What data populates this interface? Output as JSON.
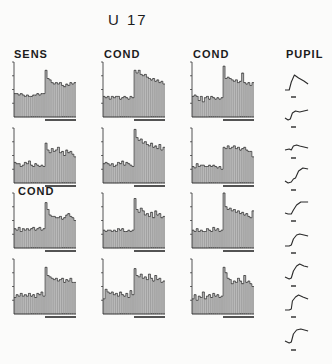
{
  "title": "U 17",
  "column_labels": {
    "sens": "SENS",
    "cond1": "COND",
    "cond2": "COND",
    "pupil": "PUPIL"
  },
  "row3_label": "COND",
  "colors": {
    "ink": "#2a2a2a",
    "bar_fill": "#b9b9b9",
    "bar_edge": "#7a7a7a",
    "background": "#fbfbfa"
  },
  "chart_data": {
    "type": "bar",
    "title": "U 17",
    "ylim": [
      0,
      4
    ],
    "yticks": 4,
    "bars_per_panel": 30,
    "stimulus_onset_bin": 15,
    "panels": [
      {
        "row": 1,
        "col": 1,
        "label": "SENS",
        "values": [
          1.7,
          1.7,
          1.6,
          1.7,
          1.6,
          1.5,
          1.6,
          1.5,
          1.5,
          1.6,
          1.6,
          1.7,
          1.6,
          1.7,
          1.7,
          3.4,
          2.8,
          2.7,
          2.5,
          2.4,
          2.5,
          2.4,
          2.5,
          2.3,
          2.2,
          2.4,
          2.3,
          2.5,
          2.4,
          2.5
        ]
      },
      {
        "row": 1,
        "col": 2,
        "label": "COND",
        "values": [
          1.5,
          1.4,
          1.5,
          1.3,
          1.5,
          1.4,
          1.5,
          1.5,
          1.3,
          1.4,
          1.5,
          1.4,
          1.3,
          1.5,
          1.4,
          3.4,
          3.2,
          3.4,
          3.1,
          3.0,
          3.1,
          2.9,
          2.8,
          2.7,
          2.8,
          2.6,
          2.7,
          2.5,
          2.6,
          2.4
        ]
      },
      {
        "row": 1,
        "col": 3,
        "label": "COND",
        "values": [
          1.5,
          1.6,
          1.5,
          1.2,
          1.5,
          1.1,
          1.4,
          1.5,
          1.3,
          1.5,
          1.4,
          1.3,
          1.4,
          1.3,
          1.4,
          3.7,
          2.8,
          2.9,
          2.8,
          2.7,
          2.6,
          2.7,
          2.5,
          2.6,
          3.2,
          2.5,
          2.4,
          2.5,
          2.3,
          2.5
        ]
      },
      {
        "row": 2,
        "col": 1,
        "label": "",
        "values": [
          1.5,
          1.4,
          1.4,
          1.2,
          1.3,
          1.5,
          1.4,
          1.6,
          1.3,
          1.2,
          1.4,
          1.3,
          1.2,
          1.3,
          1.2,
          2.9,
          2.4,
          2.2,
          2.5,
          2.3,
          2.4,
          2.6,
          2.2,
          2.3,
          2.0,
          2.4,
          2.2,
          2.3,
          2.1,
          1.9
        ]
      },
      {
        "row": 2,
        "col": 2,
        "label": "",
        "values": [
          1.4,
          1.5,
          1.4,
          1.3,
          1.4,
          1.2,
          1.3,
          1.5,
          1.4,
          1.6,
          1.3,
          1.5,
          1.4,
          1.3,
          1.2,
          3.9,
          3.3,
          3.1,
          3.2,
          2.9,
          3.0,
          2.8,
          2.7,
          2.9,
          2.6,
          2.7,
          2.5,
          2.8,
          2.4,
          2.6
        ]
      },
      {
        "row": 2,
        "col": 3,
        "label": "",
        "values": [
          1.2,
          1.1,
          1.4,
          1.2,
          1.3,
          1.3,
          1.2,
          1.2,
          1.3,
          1.2,
          1.3,
          1.2,
          1.1,
          1.2,
          1.0,
          2.6,
          2.5,
          2.7,
          2.5,
          2.6,
          2.7,
          2.5,
          2.6,
          2.4,
          2.5,
          2.6,
          2.4,
          2.3,
          2.3,
          1.9
        ]
      },
      {
        "row": 3,
        "col": 1,
        "label": "COND",
        "values": [
          1.4,
          1.3,
          1.5,
          1.2,
          1.4,
          1.3,
          1.4,
          1.3,
          1.4,
          1.5,
          1.3,
          1.4,
          1.5,
          1.3,
          1.4,
          3.3,
          2.8,
          2.4,
          2.3,
          2.3,
          2.2,
          2.2,
          2.3,
          2.1,
          2.2,
          2.4,
          2.5,
          2.3,
          2.2,
          2.0
        ]
      },
      {
        "row": 3,
        "col": 2,
        "label": "",
        "values": [
          1.3,
          1.2,
          1.3,
          1.3,
          1.2,
          1.3,
          1.2,
          1.4,
          1.3,
          1.4,
          1.2,
          1.2,
          1.3,
          1.2,
          1.3,
          3.6,
          2.8,
          2.6,
          2.9,
          2.7,
          2.4,
          2.5,
          2.3,
          2.6,
          2.2,
          2.7,
          2.4,
          2.5,
          2.2,
          2.3
        ]
      },
      {
        "row": 3,
        "col": 3,
        "label": "",
        "values": [
          1.3,
          1.2,
          1.4,
          1.2,
          1.3,
          1.2,
          1.2,
          1.4,
          1.3,
          1.2,
          1.5,
          1.3,
          1.4,
          1.2,
          1.3,
          4.0,
          3.0,
          2.8,
          2.9,
          2.7,
          2.8,
          2.6,
          2.7,
          2.5,
          2.6,
          2.4,
          2.5,
          2.3,
          2.2,
          2.7
        ]
      },
      {
        "row": 4,
        "col": 1,
        "label": "",
        "values": [
          1.2,
          1.4,
          1.3,
          1.5,
          1.3,
          1.4,
          1.3,
          1.5,
          1.3,
          1.4,
          1.2,
          1.5,
          1.4,
          1.6,
          1.3,
          3.4,
          2.8,
          2.7,
          2.6,
          2.5,
          2.6,
          2.4,
          2.5,
          2.6,
          2.3,
          2.5,
          2.4,
          2.6,
          2.3,
          2.3
        ]
      },
      {
        "row": 4,
        "col": 2,
        "label": "",
        "values": [
          1.1,
          1.8,
          1.6,
          1.5,
          1.6,
          1.4,
          1.5,
          1.3,
          1.6,
          1.4,
          1.3,
          1.5,
          1.2,
          1.7,
          1.4,
          3.3,
          2.8,
          2.7,
          2.9,
          2.6,
          2.7,
          2.5,
          2.9,
          2.6,
          2.4,
          2.8,
          2.5,
          2.6,
          2.3,
          2.4
        ]
      },
      {
        "row": 4,
        "col": 3,
        "label": "",
        "values": [
          1.1,
          1.4,
          1.0,
          1.3,
          1.2,
          1.6,
          1.1,
          1.3,
          1.4,
          1.2,
          1.5,
          1.3,
          1.4,
          1.2,
          1.3,
          3.4,
          3.0,
          2.6,
          2.5,
          2.2,
          2.4,
          2.3,
          2.6,
          2.4,
          2.2,
          2.8,
          2.3,
          2.4,
          2.2,
          2.0
        ]
      }
    ],
    "pupil_traces": [
      {
        "index": 1,
        "points": [
          [
            0,
            0
          ],
          [
            4,
            0
          ],
          [
            6,
            8
          ],
          [
            9,
            15
          ],
          [
            13,
            12
          ],
          [
            18,
            9
          ],
          [
            22,
            6
          ]
        ]
      },
      {
        "index": 2,
        "points": [
          [
            0,
            2
          ],
          [
            3,
            0
          ],
          [
            5,
            1
          ],
          [
            7,
            7
          ],
          [
            10,
            9
          ],
          [
            14,
            8
          ],
          [
            18,
            9
          ],
          [
            22,
            10
          ]
        ]
      },
      {
        "index": 3,
        "points": [
          [
            0,
            1
          ],
          [
            4,
            2
          ],
          [
            6,
            1
          ],
          [
            8,
            5
          ],
          [
            11,
            6
          ],
          [
            14,
            5
          ],
          [
            18,
            4
          ],
          [
            22,
            3
          ]
        ]
      },
      {
        "index": 4,
        "points": [
          [
            0,
            2
          ],
          [
            3,
            0
          ],
          [
            6,
            1
          ],
          [
            8,
            4
          ],
          [
            10,
            5
          ],
          [
            13,
            12
          ],
          [
            17,
            15
          ],
          [
            22,
            14
          ]
        ]
      },
      {
        "index": 5,
        "points": [
          [
            0,
            1
          ],
          [
            3,
            0
          ],
          [
            6,
            0
          ],
          [
            8,
            4
          ],
          [
            11,
            9
          ],
          [
            15,
            12
          ],
          [
            22,
            12
          ]
        ]
      },
      {
        "index": 6,
        "points": [
          [
            0,
            0
          ],
          [
            4,
            0
          ],
          [
            6,
            1
          ],
          [
            8,
            7
          ],
          [
            11,
            11
          ],
          [
            14,
            12
          ],
          [
            18,
            11
          ],
          [
            22,
            10
          ]
        ]
      },
      {
        "index": 7,
        "points": [
          [
            0,
            2
          ],
          [
            4,
            0
          ],
          [
            6,
            1
          ],
          [
            8,
            8
          ],
          [
            11,
            13
          ],
          [
            14,
            15
          ],
          [
            18,
            13
          ],
          [
            22,
            12
          ]
        ]
      },
      {
        "index": 8,
        "points": [
          [
            0,
            0
          ],
          [
            4,
            0
          ],
          [
            6,
            1
          ],
          [
            7,
            9
          ],
          [
            10,
            13
          ],
          [
            13,
            15
          ],
          [
            17,
            13
          ],
          [
            22,
            11
          ]
        ]
      },
      {
        "index": 9,
        "points": [
          [
            0,
            2
          ],
          [
            4,
            0
          ],
          [
            6,
            1
          ],
          [
            8,
            9
          ],
          [
            11,
            13
          ],
          [
            15,
            14
          ],
          [
            22,
            12
          ]
        ]
      }
    ]
  }
}
